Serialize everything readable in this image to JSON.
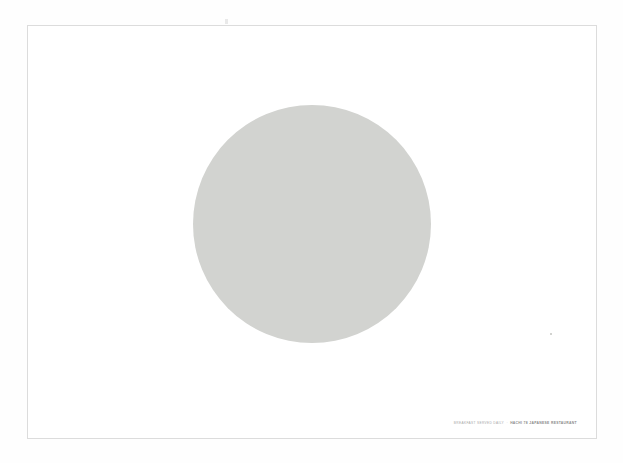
{
  "poster": {
    "title_hidden": "",
    "colors": {
      "page_background": "#fefefe",
      "paper": "#ffffff",
      "frame_border": "#dcdcdc",
      "disc_fill": "#d2d3d0",
      "caption_light": "#a8a8a8",
      "caption_strong": "#8a8a8a"
    },
    "frame": {
      "x": 27,
      "y": 25,
      "width": 570,
      "height": 414
    },
    "disc": {
      "shape": "circle",
      "center_x": 311,
      "center_y": 223,
      "diameter": 238,
      "fill": "#d2d3d0"
    },
    "caption": {
      "lead": "Breakfast served daily",
      "separator": "·",
      "brand": "Hachi 78 Japanese Restaurant",
      "full": "BREAKFAST SERVED DAILY · HACHI 78 JAPANESE RESTAURANT"
    }
  }
}
